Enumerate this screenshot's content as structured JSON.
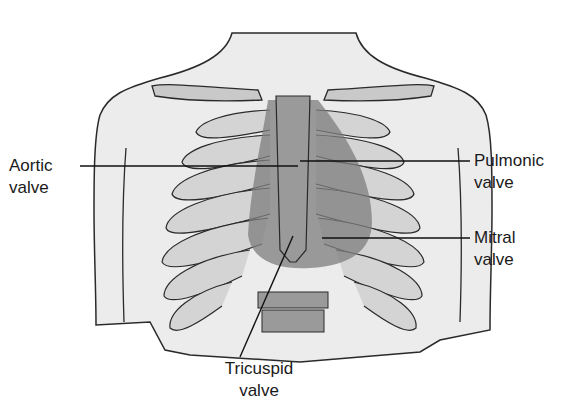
{
  "figure": {
    "labels": [
      {
        "id": "aortic",
        "line1": "Aortic",
        "line2": "valve"
      },
      {
        "id": "pulmonic",
        "line1": "Pulmonic",
        "line2": "valve"
      },
      {
        "id": "mitral",
        "line1": "Mitral",
        "line2": "valve"
      },
      {
        "id": "tricuspid",
        "line1": "Tricuspid",
        "line2": "valve"
      }
    ]
  },
  "colors": {
    "skin": "#ececec",
    "outline": "#2a2a2a",
    "bone": "#c9c9c9",
    "cartilage": "#9a9a9a",
    "heart": "#7d7d7d",
    "leader": "#111111"
  }
}
